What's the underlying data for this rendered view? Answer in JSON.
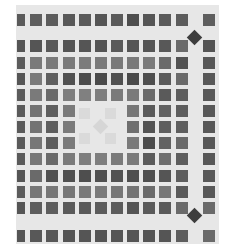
{
  "image": {
    "description": "Grayscale mosaic tile pattern of dark square tiles on light grout with diamond accents",
    "background": "#ffffff",
    "panel_color": "#e7e7e7",
    "columns_x": [
      17,
      30,
      46,
      63,
      79,
      95,
      111,
      127,
      143,
      159,
      176,
      203
    ],
    "rows_y": [
      14,
      40,
      57,
      73,
      89,
      105,
      121,
      137,
      153,
      170,
      186,
      202,
      230
    ],
    "first_col_width": 8,
    "tile_size": 12,
    "shades": [
      [
        "#5a5a5a",
        "#5e5e5e",
        "#5c5c5c",
        "#585858",
        "#5a5a5a",
        "#555555",
        "#5a5a5a",
        "#4e4e4e",
        "#555555",
        "#5a5a5a",
        "#5c5c5c",
        "#5e5e5e"
      ],
      [
        "#555555",
        "#555555",
        "#595959",
        "#555555",
        "#555555",
        "#555555",
        "#5a5a5a",
        "#555555",
        "#555555",
        "#585858",
        "#6a6a6a",
        "#555555"
      ],
      [
        "#5c5c5c",
        "#7a7a7a",
        "#7a7a7a",
        "#7a7a7a",
        "#7c7c7c",
        "#7a7a7a",
        "#7a7a7a",
        "#7a7a7a",
        "#7a7a7a",
        "#6a6a6a",
        "#525252",
        "#585858"
      ],
      [
        "#555555",
        "#7a7a7a",
        "#5e5e5e",
        "#505050",
        "#4c4c4c",
        "#4a4a4a",
        "#505050",
        "#4a4a4a",
        "#4e4e4e",
        "#5a5a5a",
        "#6a6a6a",
        "#585858"
      ],
      [
        "#5c5c5c",
        "#7a7a7a",
        "#6a6a6a",
        "#7e7e7e",
        "#808080",
        "#7e7e7e",
        "#7a7a7a",
        "#7a7a7a",
        "#6a6a6a",
        "#5a5a5a",
        "#5e5e5e",
        "#585858"
      ],
      [
        "#5a5a5a",
        "#737373",
        "#5e5e5e",
        "#7a7a7a",
        null,
        null,
        null,
        "#777777",
        "#5a5a5a",
        "#626262",
        "#5e5e5e",
        "#585858"
      ],
      [
        "#5a5a5a",
        "#737373",
        "#5e5e5e",
        "#7a7a7a",
        null,
        null,
        null,
        "#6e6e6e",
        "#525252",
        "#5e5e5e",
        "#5e5e5e",
        "#585858"
      ],
      [
        "#5a5a5a",
        "#777777",
        "#5e5e5e",
        "#7a7a7a",
        null,
        null,
        null,
        "#7a7a7a",
        "#4c4c4c",
        "#626262",
        "#6a6a6a",
        "#585858"
      ],
      [
        "#5a5a5a",
        "#777777",
        "#6a6a6a",
        "#7a7a7a",
        "#7e7e7e",
        "#7e7e7e",
        "#7a7a7a",
        "#7a7a7a",
        "#5a5a5a",
        "#6e6e6e",
        "#5e5e5e",
        "#585858"
      ],
      [
        "#555555",
        "#6a6a6a",
        "#505050",
        "#505050",
        "#4e4e4e",
        "#505050",
        "#525252",
        "#4e4e4e",
        "#4e4e4e",
        "#555555",
        "#5e5e5e",
        "#585858"
      ],
      [
        "#5c5c5c",
        "#777777",
        "#777777",
        "#777777",
        "#7a7a7a",
        "#7a7a7a",
        "#777777",
        "#747474",
        "#6a6a6a",
        "#777777",
        "#5a5a5a",
        "#585858"
      ],
      [
        "#555555",
        "#5e5e5e",
        "#5e5e5e",
        "#5a5a5a",
        "#5a5a5a",
        "#5c5c5c",
        "#5c5c5c",
        "#555555",
        "#5a5a5a",
        "#5a5a5a",
        "#6a6a6a",
        "#6a6a6a"
      ],
      [
        "#555555",
        "#585858",
        "#585858",
        "#555555",
        "#555555",
        "#555555",
        "#555555",
        "#555555",
        "#555555",
        "#555555",
        "#5e5e5e",
        "#6a6a6a"
      ]
    ],
    "diamonds": [
      {
        "x": 194,
        "y": 37,
        "color": "#3e3e3e"
      },
      {
        "x": 194,
        "y": 215,
        "color": "#3e3e3e"
      },
      {
        "x": 100,
        "y": 126,
        "color": "#d6d6d6"
      }
    ],
    "faint_squares": [
      {
        "x": 79,
        "y": 108,
        "color": "#dadada"
      },
      {
        "x": 105,
        "y": 108,
        "color": "#dadada"
      },
      {
        "x": 79,
        "y": 133,
        "color": "#dadada"
      },
      {
        "x": 105,
        "y": 133,
        "color": "#dadada"
      }
    ]
  }
}
